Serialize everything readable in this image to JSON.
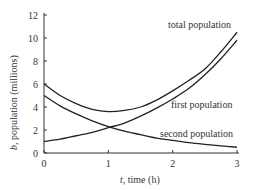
{
  "chart_data": {
    "type": "line",
    "title": "",
    "xlabel_var": "t",
    "xlabel_rest": ", time (h)",
    "ylabel_var": "b",
    "ylabel_rest": ", population (millions)",
    "xlim": [
      0,
      3
    ],
    "ylim": [
      0,
      12
    ],
    "xticks": [
      0,
      1,
      2,
      3
    ],
    "yticks": [
      0,
      2,
      4,
      6,
      8,
      10,
      12
    ],
    "grid": false,
    "legend": "inline labels",
    "values_note": "Approximate: read off the pixels and smoothed with a fitted exponential model (growth ~e^{0.77t}, decay ~5e^{-0.77t}). Not exact plotted values.",
    "x": [
      0,
      0.25,
      0.5,
      0.75,
      1.0,
      1.25,
      1.5,
      1.75,
      2.0,
      2.25,
      2.5,
      2.75,
      3.0
    ],
    "series": [
      {
        "name": "total population",
        "values": [
          6.0,
          5.0,
          4.3,
          3.8,
          3.6,
          3.7,
          4.0,
          4.6,
          5.4,
          6.3,
          7.3,
          8.8,
          10.5
        ]
      },
      {
        "name": "first population",
        "values": [
          1.0,
          1.2,
          1.5,
          1.8,
          2.2,
          2.6,
          3.2,
          3.9,
          4.7,
          5.6,
          6.8,
          8.2,
          9.8
        ]
      },
      {
        "name": "second population",
        "values": [
          5.0,
          4.1,
          3.4,
          2.8,
          2.3,
          1.9,
          1.6,
          1.3,
          1.1,
          0.9,
          0.75,
          0.62,
          0.5
        ]
      }
    ],
    "annotations": [
      {
        "text": "total population",
        "series": 0
      },
      {
        "text": "first population",
        "series": 1
      },
      {
        "text": "second population",
        "series": 2
      }
    ]
  }
}
